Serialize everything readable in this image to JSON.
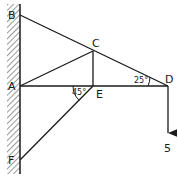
{
  "diagram": {
    "type": "truss",
    "points": {
      "B": {
        "label": "B",
        "x": 20,
        "y": 15
      },
      "A": {
        "label": "A",
        "x": 20,
        "y": 86
      },
      "F": {
        "label": "F",
        "x": 20,
        "y": 160
      },
      "C": {
        "label": "C",
        "x": 93,
        "y": 51
      },
      "E": {
        "label": "E",
        "x": 93,
        "y": 86
      },
      "D": {
        "label": "D",
        "x": 168,
        "y": 86
      }
    },
    "members": [
      "BD",
      "AC",
      "AD",
      "CE",
      "FE"
    ],
    "angles": {
      "at_D": "25°",
      "at_E": "45°"
    },
    "load": {
      "label": "5",
      "direction": "down",
      "at": "D"
    },
    "support": "wall"
  }
}
